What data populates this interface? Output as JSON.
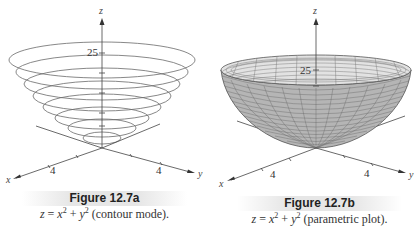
{
  "figures": [
    {
      "id": "12.7a",
      "title": "Figure 12.7a",
      "equation": {
        "lhs": "z",
        "eq": " = ",
        "x": "x",
        "xp": "2",
        "plus": " + ",
        "y": "y",
        "yp": "2"
      },
      "mode": " (contour mode).",
      "axes": {
        "z": "z",
        "x": "x",
        "y": "y"
      },
      "z_tick": "25",
      "x_tick": "4",
      "y_tick": "4",
      "style": "contour",
      "contour_levels": 8
    },
    {
      "id": "12.7b",
      "title": "Figure 12.7b",
      "equation": {
        "lhs": "z",
        "eq": " = ",
        "x": "x",
        "xp": "2",
        "plus": " + ",
        "y": "y",
        "yp": "2"
      },
      "mode": " (parametric plot).",
      "axes": {
        "z": "z",
        "x": "x",
        "y": "y"
      },
      "z_tick": "25",
      "x_tick": "4",
      "y_tick": "4",
      "style": "parametric surface"
    }
  ],
  "colors": {
    "line": "#555555",
    "surface": "#b8b8b8",
    "surface_dark": "#a6a6a6",
    "inner": "#e4e4e4",
    "caption_bar": "#e6e6e6"
  }
}
